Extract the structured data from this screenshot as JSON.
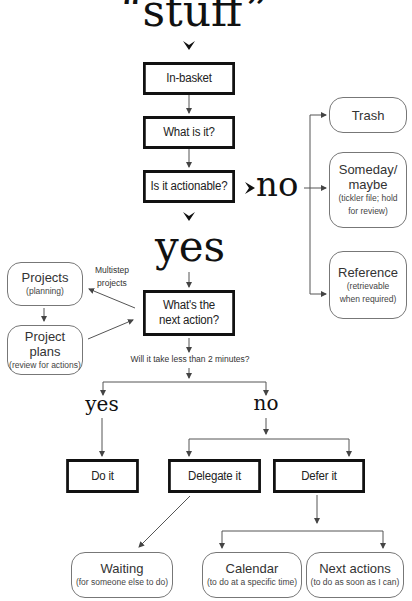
{
  "title": "“stuff”",
  "nodes": {
    "in_basket": "In-basket",
    "what_is_it": "What is it?",
    "is_actionable": "Is it actionable?",
    "next_action": [
      "What's the",
      "next action?"
    ],
    "do_it": "Do it",
    "delegate_it": "Delegate it",
    "defer_it": "Defer it"
  },
  "labels": {
    "no_actionable": "no",
    "yes_actionable": "yes",
    "multistep": [
      "Multistep",
      "projects"
    ],
    "two_minutes": "Will it take less than 2 minutes?",
    "yes_two_min": "yes",
    "no_two_min": "no"
  },
  "outcomes": {
    "trash": {
      "title": "Trash"
    },
    "someday": {
      "title": [
        "Someday/",
        "maybe"
      ],
      "note": [
        "(tickler file; hold",
        "for review)"
      ]
    },
    "reference": {
      "title": "Reference",
      "note": [
        "(retrievable",
        "when required)"
      ]
    },
    "projects": {
      "title": "Projects",
      "note": "(planning)"
    },
    "project_plans": {
      "title": "Project plans",
      "note": "(review for actions)"
    },
    "waiting": {
      "title": "Waiting",
      "note": "(for someone else to do)"
    },
    "calendar": {
      "title": "Calendar",
      "note": "(to do at a specific time)"
    },
    "next_actions": {
      "title": "Next actions",
      "note": "(to do as soon as I can)"
    }
  },
  "colors": {
    "box_border": "#111111",
    "rounded_border": "#777777",
    "line": "#555555"
  }
}
